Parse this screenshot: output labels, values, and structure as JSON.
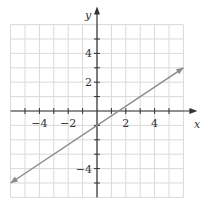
{
  "chart_data": {
    "type": "line",
    "title": "",
    "xlabel": "x",
    "ylabel": "y",
    "xlim": [
      -6,
      6
    ],
    "ylim": [
      -6,
      6
    ],
    "grid": true,
    "x_ticks": [
      -4,
      -2,
      2,
      4
    ],
    "y_ticks": [
      -4,
      2,
      4
    ],
    "x_tick_labels": [
      "−4",
      "−2",
      "2",
      "4"
    ],
    "y_tick_labels": [
      "−4",
      "2",
      "4"
    ],
    "series": [
      {
        "name": "y = (2/3)x − 1",
        "equation": "y = (2/3)x - 1",
        "slope": 0.6667,
        "intercept": -1,
        "x": [
          -6,
          0,
          1.5,
          6
        ],
        "y": [
          -5,
          -1,
          0,
          3
        ],
        "arrows": "both",
        "color": "#8a8a8a"
      }
    ]
  },
  "colors": {
    "grid": "#d9d9d9",
    "axis": "#333333",
    "line": "#8a8a8a"
  }
}
